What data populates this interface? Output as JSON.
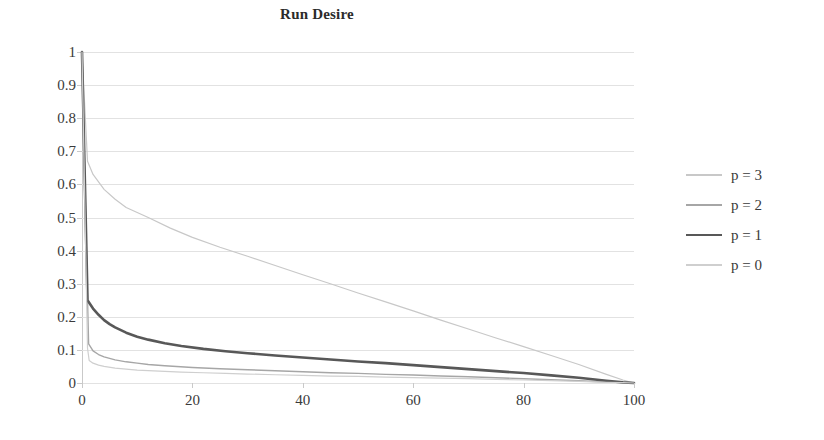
{
  "chart_data": {
    "type": "line",
    "title": "Run Desire",
    "xlabel": "",
    "ylabel": "",
    "xlim": [
      0,
      100
    ],
    "ylim": [
      0,
      1
    ],
    "xticks": [
      0,
      20,
      40,
      60,
      80,
      100
    ],
    "xtick_labels": [
      "0",
      "20",
      "40",
      "60",
      "80",
      "100"
    ],
    "yticks": [
      0,
      0.1,
      0.2,
      0.3,
      0.4,
      0.5,
      0.6,
      0.7,
      0.8,
      0.9,
      1
    ],
    "ytick_labels": [
      "0",
      "0.1",
      "0.2",
      "0.3",
      "0.4",
      "0.5",
      "0.6",
      "0.7",
      "0.8",
      "0.9",
      "1"
    ],
    "grid": "horizontal",
    "legend_position": "right",
    "series": [
      {
        "name": "p = 3",
        "color": "#c8c8c8",
        "width": 1.2,
        "x": [
          0,
          1,
          2,
          4,
          6,
          8,
          10,
          12,
          16,
          20,
          25,
          30,
          35,
          40,
          45,
          50,
          55,
          60,
          65,
          70,
          75,
          80,
          85,
          90,
          95,
          98,
          100
        ],
        "y": [
          1.0,
          0.67,
          0.63,
          0.585,
          0.555,
          0.53,
          0.515,
          0.5,
          0.468,
          0.44,
          0.41,
          0.383,
          0.355,
          0.327,
          0.3,
          0.272,
          0.245,
          0.218,
          0.19,
          0.163,
          0.136,
          0.11,
          0.083,
          0.056,
          0.026,
          0.009,
          0.0
        ]
      },
      {
        "name": "p = 2",
        "color": "#a6a6a6",
        "width": 1.4,
        "x": [
          0,
          1,
          1.2,
          2,
          3,
          4,
          6,
          8,
          10,
          12,
          15,
          20,
          25,
          30,
          35,
          40,
          45,
          50,
          55,
          60,
          65,
          70,
          75,
          80,
          85,
          90,
          95,
          98,
          100
        ],
        "y": [
          1.0,
          0.25,
          0.118,
          0.097,
          0.086,
          0.079,
          0.07,
          0.064,
          0.06,
          0.056,
          0.052,
          0.047,
          0.043,
          0.04,
          0.037,
          0.034,
          0.031,
          0.029,
          0.026,
          0.024,
          0.021,
          0.019,
          0.016,
          0.013,
          0.01,
          0.007,
          0.003,
          0.001,
          0.0
        ]
      },
      {
        "name": "p = 1",
        "color": "#585858",
        "width": 2.6,
        "x": [
          0,
          1,
          2,
          3,
          4,
          5,
          6,
          8,
          10,
          12,
          15,
          18,
          22,
          26,
          30,
          35,
          40,
          45,
          50,
          55,
          60,
          65,
          70,
          75,
          80,
          85,
          90,
          95,
          98,
          100
        ],
        "y": [
          1.0,
          0.25,
          0.225,
          0.206,
          0.19,
          0.178,
          0.168,
          0.152,
          0.14,
          0.131,
          0.12,
          0.112,
          0.103,
          0.096,
          0.09,
          0.083,
          0.077,
          0.071,
          0.065,
          0.06,
          0.054,
          0.048,
          0.042,
          0.036,
          0.03,
          0.023,
          0.016,
          0.007,
          0.002,
          0.0
        ]
      },
      {
        "name": "p = 0",
        "color": "#cfcfcf",
        "width": 1.2,
        "x": [
          0,
          1,
          1.3,
          2,
          3,
          4,
          6,
          8,
          10,
          14,
          18,
          22,
          26,
          30,
          35,
          40,
          45,
          50,
          55,
          60,
          65,
          70,
          75,
          80,
          85,
          90,
          95,
          98,
          100
        ],
        "y": [
          1.0,
          0.105,
          0.068,
          0.06,
          0.054,
          0.05,
          0.045,
          0.042,
          0.039,
          0.036,
          0.033,
          0.031,
          0.029,
          0.027,
          0.025,
          0.023,
          0.021,
          0.02,
          0.018,
          0.016,
          0.015,
          0.013,
          0.011,
          0.009,
          0.007,
          0.005,
          0.002,
          0.001,
          0.0
        ]
      }
    ]
  },
  "legend": {
    "items": [
      {
        "label": "p = 3"
      },
      {
        "label": "p = 2"
      },
      {
        "label": "p = 1"
      },
      {
        "label": "p = 0"
      }
    ]
  }
}
